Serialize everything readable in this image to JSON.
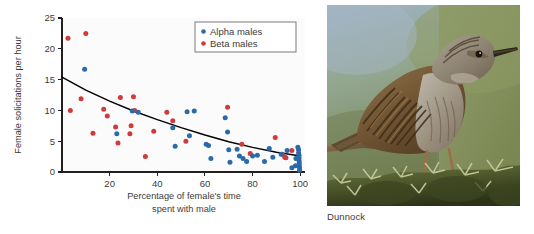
{
  "figure": {
    "panels": [
      "scatter-plot",
      "bird-photo"
    ]
  },
  "photo": {
    "caption": "Dunnock",
    "subject": "dunnock-bird-on-gorse",
    "alt": "Brown streaked dunnock perched on gorse bush against green and blue background"
  },
  "chart_data": {
    "type": "scatter",
    "title": "",
    "xlabel_line1": "Percentage of female's time",
    "xlabel_line2": "spent with male",
    "ylabel": "Female solicitations per hour",
    "xlim": [
      0,
      102
    ],
    "ylim": [
      0,
      25
    ],
    "xticks": [
      20,
      40,
      60,
      80,
      100
    ],
    "yticks": [
      0,
      5,
      10,
      15,
      20,
      25
    ],
    "xtick_labels": [
      "20",
      "40",
      "60",
      "80",
      "100"
    ],
    "ytick_labels": [
      "0",
      "5",
      "10",
      "15",
      "20",
      "25"
    ],
    "grid": false,
    "legend_position": "top-right",
    "colors": {
      "alpha": "#2a6aa8",
      "beta": "#cf3b3b",
      "curve": "#000000",
      "axis": "#231f20",
      "text": "#3b3b3b"
    },
    "series": [
      {
        "name": "Alpha males",
        "color": "#2a6aa8",
        "points": [
          [
            9.5,
            16.7
          ],
          [
            23.0,
            6.2
          ],
          [
            29.5,
            9.9
          ],
          [
            32.0,
            9.7
          ],
          [
            46.5,
            7.2
          ],
          [
            47.5,
            4.2
          ],
          [
            52.5,
            9.8
          ],
          [
            53.5,
            5.9
          ],
          [
            55.5,
            9.9
          ],
          [
            60.5,
            4.5
          ],
          [
            61.5,
            4.3
          ],
          [
            62.5,
            2.2
          ],
          [
            68.5,
            8.8
          ],
          [
            69.5,
            6.5
          ],
          [
            70.0,
            3.6
          ],
          [
            70.5,
            1.6
          ],
          [
            73.5,
            3.7
          ],
          [
            74.5,
            2.6
          ],
          [
            76.0,
            2.2
          ],
          [
            77.5,
            1.7
          ],
          [
            80.0,
            2.6
          ],
          [
            82.0,
            2.7
          ],
          [
            85.0,
            1.7
          ],
          [
            87.0,
            3.8
          ],
          [
            88.5,
            2.4
          ],
          [
            92.0,
            2.9
          ],
          [
            94.5,
            3.5
          ],
          [
            96.5,
            0.7
          ],
          [
            99.0,
            4.0
          ],
          [
            99.3,
            3.6
          ],
          [
            99.3,
            3.1
          ],
          [
            99.5,
            2.7
          ],
          [
            99.5,
            2.3
          ],
          [
            99.5,
            1.9
          ],
          [
            99.6,
            1.5
          ],
          [
            99.6,
            1.1
          ],
          [
            99.7,
            0.7
          ],
          [
            99.7,
            0.3
          ],
          [
            98.2,
            2.2
          ],
          [
            98.0,
            1.0
          ]
        ]
      },
      {
        "name": "Beta males",
        "color": "#cf3b3b",
        "points": [
          [
            2.5,
            21.7
          ],
          [
            3.5,
            10.0
          ],
          [
            8.0,
            11.9
          ],
          [
            10.0,
            22.5
          ],
          [
            13.0,
            6.3
          ],
          [
            17.5,
            10.2
          ],
          [
            19.0,
            9.1
          ],
          [
            22.5,
            7.3
          ],
          [
            23.5,
            4.7
          ],
          [
            24.5,
            12.1
          ],
          [
            28.5,
            6.2
          ],
          [
            29.0,
            7.5
          ],
          [
            30.0,
            12.2
          ],
          [
            30.5,
            10.0
          ],
          [
            35.0,
            2.5
          ],
          [
            38.5,
            6.6
          ],
          [
            44.0,
            9.7
          ],
          [
            46.5,
            8.3
          ],
          [
            52.0,
            5.0
          ],
          [
            69.5,
            10.5
          ],
          [
            75.5,
            4.5
          ],
          [
            79.0,
            3.0
          ],
          [
            89.5,
            5.6
          ],
          [
            92.5,
            2.9
          ],
          [
            93.5,
            2.4
          ],
          [
            94.0,
            2.3
          ],
          [
            96.5,
            3.5
          ]
        ]
      }
    ],
    "fit_curve": {
      "description": "negative exponential decay fitted to all points",
      "points": [
        [
          0,
          15.4
        ],
        [
          10,
          13.3
        ],
        [
          20,
          11.5
        ],
        [
          30,
          9.9
        ],
        [
          40,
          8.5
        ],
        [
          50,
          7.2
        ],
        [
          60,
          6.0
        ],
        [
          70,
          4.9
        ],
        [
          80,
          4.0
        ],
        [
          90,
          3.2
        ],
        [
          100,
          2.6
        ]
      ]
    },
    "legend": [
      {
        "label": "Alpha males",
        "color": "#2a6aa8"
      },
      {
        "label": "Beta males",
        "color": "#cf3b3b"
      }
    ]
  }
}
